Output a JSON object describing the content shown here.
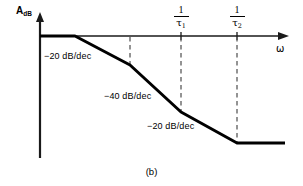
{
  "figure": {
    "caption": "(b)",
    "axes": {
      "y_label_main": "A",
      "y_label_sub": "dB",
      "x_label": "ω"
    },
    "tick_labels": [
      {
        "numerator": "1",
        "denominator": "τ",
        "denominator_sub": "1"
      },
      {
        "numerator": "1",
        "denominator": "τ",
        "denominator_sub": "2"
      }
    ],
    "slope_labels": [
      "−20 dB/dec",
      "−40 dB/dec",
      "−20 dB/dec"
    ],
    "colors": {
      "curve": "#000000",
      "axis": "#1a1a1a",
      "dashed": "#555555",
      "background": "#ffffff"
    }
  },
  "chart_data": {
    "type": "line",
    "title": "",
    "subtitle": "",
    "xlabel": "ω",
    "ylabel": "A_dB",
    "grid": false,
    "legend": null,
    "axis_style": "arrow-terminated semilog asymptotic Bode magnitude plot",
    "xlim": [
      40,
      288
    ],
    "ylim_pixels": [
      13,
      158
    ],
    "x_axis_pixel_y": 36,
    "y_axis_pixel_x": 40,
    "series": [
      {
        "name": "asymptotic magnitude response",
        "points": [
          {
            "x": 40,
            "y": 36
          },
          {
            "x": 75,
            "y": 36
          },
          {
            "x": 130,
            "y": 65
          },
          {
            "x": 181,
            "y": 112
          },
          {
            "x": 237,
            "y": 143
          },
          {
            "x": 285,
            "y": 143
          }
        ]
      }
    ],
    "segments": [
      {
        "from": 0,
        "to": 1,
        "slope_label": "0 dB/dec"
      },
      {
        "from": 1,
        "to": 2,
        "slope_label": "−20 dB/dec"
      },
      {
        "from": 2,
        "to": 3,
        "slope_label": "−40 dB/dec"
      },
      {
        "from": 3,
        "to": 4,
        "slope_label": "−20 dB/dec"
      },
      {
        "from": 4,
        "to": 5,
        "slope_label": "0 dB/dec"
      }
    ],
    "annotations": [
      {
        "text": "−20 dB/dec",
        "x": 44,
        "y": 52
      },
      {
        "text": "−40 dB/dec",
        "x": 104,
        "y": 92
      },
      {
        "text": "−20 dB/dec",
        "x": 147,
        "y": 122
      }
    ],
    "dashed_guides": [
      {
        "x": 130,
        "y_top": 36,
        "y_bottom": 65,
        "label": null
      },
      {
        "x": 181,
        "y_top": 36,
        "y_bottom": 112,
        "label": "1/τ₁"
      },
      {
        "x": 237,
        "y_top": 36,
        "y_bottom": 143,
        "label": "1/τ₂"
      }
    ],
    "tick_positions_x": [
      181,
      237
    ],
    "tick_labels_x": [
      "1/τ₁",
      "1/τ₂"
    ]
  }
}
